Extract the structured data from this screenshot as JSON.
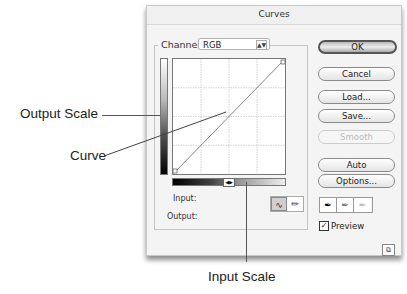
{
  "dialog": {
    "title": "Curves",
    "channel": {
      "label": "Channel:",
      "value": "RGB"
    },
    "fields": {
      "input_label": "Input:",
      "output_label": "Output:"
    },
    "tools": {
      "curve_tool": "curve-icon",
      "pencil_tool": "pencil-icon"
    },
    "buttons": {
      "ok": "OK",
      "cancel": "Cancel",
      "load": "Load...",
      "save": "Save...",
      "smooth": "Smooth",
      "auto": "Auto",
      "options": "Options..."
    },
    "eyedroppers": [
      "black-point-eyedropper",
      "gray-point-eyedropper",
      "white-point-eyedropper"
    ],
    "preview": {
      "label": "Preview",
      "checked": true
    },
    "grid": {
      "divisions": 4,
      "curve": [
        [
          0,
          0
        ],
        [
          255,
          255
        ]
      ]
    }
  },
  "annotations": {
    "output_scale": "Output Scale",
    "curve": "Curve",
    "input_scale": "Input Scale"
  }
}
